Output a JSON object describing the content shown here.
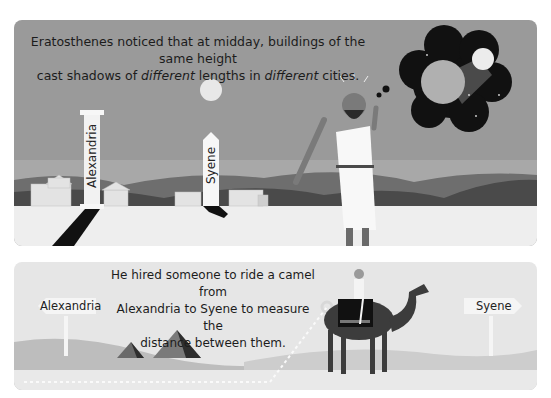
{
  "panels": {
    "top": {
      "caption_line1": "Eratosthenes noticed that at midday, buildings of the same height",
      "caption_line2_parts": [
        "cast shadows of ",
        "different",
        " lengths in ",
        "different",
        " cities."
      ],
      "column_label": "Alexandria",
      "obelisk_label": "Syene",
      "thought_bubble": "earth-and-sun-in-space"
    },
    "bottom": {
      "caption_lines": [
        "He hired someone to ride a camel from",
        "Alexandria to Syene to measure the",
        "distance between them."
      ],
      "sign_left": "Alexandria",
      "sign_right": "Syene"
    }
  },
  "colors": {
    "sky": "#9a9a9a",
    "ground_top": "#eeeeee",
    "hills_dark": "#4a4a4a",
    "hills_mid": "#6e6e6e",
    "shadow": "#111111",
    "bottom_bg": "#e6e6e6",
    "dunes": "#bdbdbd",
    "camel": "#3c3c3c"
  }
}
